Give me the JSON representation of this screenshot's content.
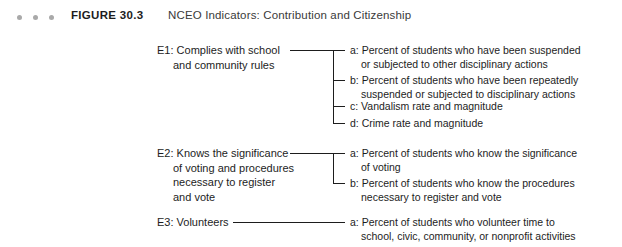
{
  "header": {
    "figure_label": "FIGURE 30.3",
    "title": "NCEO Indicators: Contribution and Citizenship",
    "dot_color": "#a9a9a9",
    "dot_count": 3
  },
  "diagram": {
    "line_color": "#1d1d1d",
    "groups": [
      {
        "id": "E1",
        "label_line1": "E1: Complies with school",
        "label_line2": "and community rules",
        "items": [
          {
            "key": "a",
            "line1": "a: Percent of students who have been suspended",
            "line2": "or subjected to other disciplinary actions"
          },
          {
            "key": "b",
            "line1": "b: Percent of students who have been repeatedly",
            "line2": "suspended or subjected to disciplinary actions"
          },
          {
            "key": "c",
            "line1": "c: Vandalism rate and magnitude",
            "line2": ""
          },
          {
            "key": "d",
            "line1": "d: Crime rate and magnitude",
            "line2": ""
          }
        ]
      },
      {
        "id": "E2",
        "label_line1": "E2: Knows the significance",
        "label_line2": "of voting and procedures",
        "label_line3": "necessary to register",
        "label_line4": "and vote",
        "items": [
          {
            "key": "a",
            "line1": "a: Percent of students who know the significance",
            "line2": "of voting"
          },
          {
            "key": "b",
            "line1": "b: Percent of students who know the procedures",
            "line2": "necessary to register and vote"
          }
        ]
      },
      {
        "id": "E3",
        "label_line1": "E3: Volunteers",
        "items": [
          {
            "key": "a",
            "line1": "a: Percent of students who volunteer time to",
            "line2": "school, civic, community, or nonprofit activities"
          }
        ]
      }
    ]
  }
}
